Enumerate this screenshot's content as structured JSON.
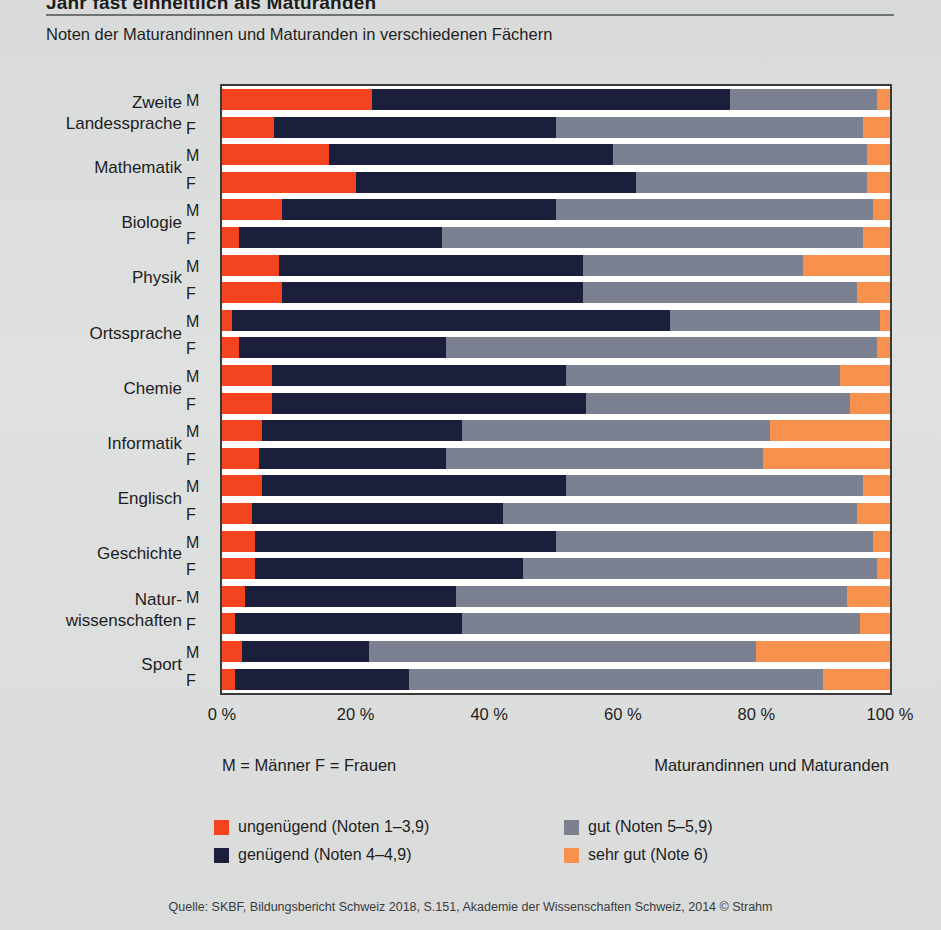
{
  "header": {
    "title": "Jahr fast einheitlich als Maturanden",
    "subtitle": "Noten der Maturandinnen und Maturanden in verschiedenen Fächern"
  },
  "axis": {
    "xticks": [
      "0 %",
      "20 %",
      "40 %",
      "60 %",
      "80 %",
      "100 %"
    ],
    "xtick_values": [
      0,
      20,
      40,
      60,
      80,
      100
    ]
  },
  "footer": {
    "left": "M = Männer   F = Frauen",
    "right": "Maturandinnen und Maturanden",
    "source": "Quelle: SKBF, Bildungsbericht Schweiz 2018, S.151, Akademie der Wissenschaften Schweiz, 2014  © Strahm"
  },
  "legend": {
    "items": [
      {
        "label": "ungenügend (Noten 1–3,9)",
        "color": "#f4441f"
      },
      {
        "label": "gut (Noten 5–5,9)",
        "color": "#7b8190"
      },
      {
        "label": "genügend (Noten 4–4,9)",
        "color": "#1b1f3b"
      },
      {
        "label": "sehr gut (Note 6)",
        "color": "#f8914e"
      }
    ]
  },
  "chart_data": {
    "type": "bar",
    "orientation": "horizontal",
    "stacked": true,
    "stack_mode": "percent",
    "title": "Noten der Maturandinnen und Maturanden in verschiedenen Fächern",
    "xlabel": "",
    "ylabel": "",
    "xlim": [
      0,
      100
    ],
    "grid": false,
    "legend_position": "bottom",
    "series": [
      {
        "name": "ungenügend (Noten 1–3,9)",
        "color": "#f4441f"
      },
      {
        "name": "genügend (Noten 4–4,9)",
        "color": "#1b1f3b"
      },
      {
        "name": "gut (Noten 5–5,9)",
        "color": "#7b8190"
      },
      {
        "name": "sehr gut (Note 6)",
        "color": "#f8914e"
      }
    ],
    "groups": [
      {
        "label": "Zweite\nLandessprache",
        "label_lines": [
          "Zweite",
          "Landessprache"
        ]
      },
      {
        "label": "Mathematik",
        "label_lines": [
          "Mathematik"
        ]
      },
      {
        "label": "Biologie",
        "label_lines": [
          "Biologie"
        ]
      },
      {
        "label": "Physik",
        "label_lines": [
          "Physik"
        ]
      },
      {
        "label": "Ortssprache",
        "label_lines": [
          "Ortssprache"
        ]
      },
      {
        "label": "Chemie",
        "label_lines": [
          "Chemie"
        ]
      },
      {
        "label": "Informatik",
        "label_lines": [
          "Informatik"
        ]
      },
      {
        "label": "Englisch",
        "label_lines": [
          "Englisch"
        ]
      },
      {
        "label": "Geschichte",
        "label_lines": [
          "Geschichte"
        ]
      },
      {
        "label": "Naturwissenschaften",
        "label_lines": [
          "Natur-",
          "wissenschaften"
        ]
      },
      {
        "label": "Sport",
        "label_lines": [
          "Sport"
        ]
      }
    ],
    "bars": [
      {
        "group": "Zweite Landessprache",
        "sex": "M",
        "values": [
          22.5,
          53.5,
          22.0,
          2.0
        ]
      },
      {
        "group": "Zweite Landessprache",
        "sex": "F",
        "values": [
          7.8,
          42.2,
          46.0,
          4.0
        ]
      },
      {
        "group": "Mathematik",
        "sex": "M",
        "values": [
          16.0,
          42.5,
          38.0,
          3.5
        ]
      },
      {
        "group": "Mathematik",
        "sex": "F",
        "values": [
          20.0,
          42.0,
          34.5,
          3.5
        ]
      },
      {
        "group": "Biologie",
        "sex": "M",
        "values": [
          9.0,
          41.0,
          47.5,
          2.5
        ]
      },
      {
        "group": "Biologie",
        "sex": "F",
        "values": [
          2.5,
          30.5,
          63.0,
          4.0
        ]
      },
      {
        "group": "Physik",
        "sex": "M",
        "values": [
          8.5,
          45.5,
          33.0,
          13.0
        ]
      },
      {
        "group": "Physik",
        "sex": "F",
        "values": [
          9.0,
          45.0,
          41.0,
          5.0
        ]
      },
      {
        "group": "Ortssprache",
        "sex": "M",
        "values": [
          1.5,
          65.5,
          31.5,
          1.5
        ]
      },
      {
        "group": "Ortssprache",
        "sex": "F",
        "values": [
          2.5,
          31.0,
          64.5,
          2.0
        ]
      },
      {
        "group": "Chemie",
        "sex": "M",
        "values": [
          7.5,
          44.0,
          41.0,
          7.5
        ]
      },
      {
        "group": "Chemie",
        "sex": "F",
        "values": [
          7.5,
          47.0,
          39.5,
          6.0
        ]
      },
      {
        "group": "Informatik",
        "sex": "M",
        "values": [
          6.0,
          30.0,
          46.0,
          18.0
        ]
      },
      {
        "group": "Informatik",
        "sex": "F",
        "values": [
          5.5,
          28.0,
          47.5,
          19.0
        ]
      },
      {
        "group": "Englisch",
        "sex": "M",
        "values": [
          6.0,
          45.5,
          44.5,
          4.0
        ]
      },
      {
        "group": "Englisch",
        "sex": "F",
        "values": [
          4.5,
          37.5,
          53.0,
          5.0
        ]
      },
      {
        "group": "Geschichte",
        "sex": "M",
        "values": [
          5.0,
          45.0,
          47.5,
          2.5
        ]
      },
      {
        "group": "Geschichte",
        "sex": "F",
        "values": [
          5.0,
          40.0,
          53.0,
          2.0
        ]
      },
      {
        "group": "Naturwissenschaften",
        "sex": "M",
        "values": [
          3.5,
          31.5,
          58.5,
          6.5
        ]
      },
      {
        "group": "Naturwissenschaften",
        "sex": "F",
        "values": [
          2.0,
          34.0,
          59.5,
          4.5
        ]
      },
      {
        "group": "Sport",
        "sex": "M",
        "values": [
          3.0,
          19.0,
          58.0,
          20.0
        ]
      },
      {
        "group": "Sport",
        "sex": "F",
        "values": [
          2.0,
          26.0,
          62.0,
          10.0
        ]
      }
    ]
  }
}
